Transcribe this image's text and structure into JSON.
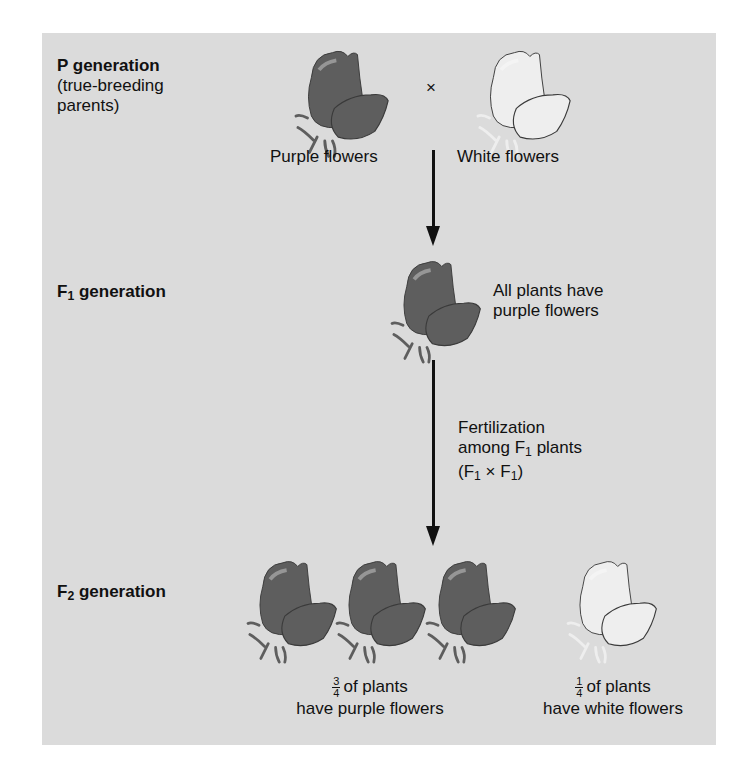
{
  "diagram": {
    "background_color": "#dbdbdb",
    "colors": {
      "purple_flower": "#5e5e5e",
      "white_flower": "#eeeeee",
      "text": "#111111"
    },
    "p_generation": {
      "label_bold": "P generation",
      "label_line2": "(true-breeding",
      "label_line3": "parents)",
      "cross_symbol": "×",
      "parent1_label": "Purple flowers",
      "parent2_label": "White flowers"
    },
    "f1_generation": {
      "label_prefix": "F",
      "label_sub": "1",
      "label_suffix": " generation",
      "description_line1": "All plants have",
      "description_line2": "purple flowers"
    },
    "fertilization": {
      "line1": "Fertilization",
      "line2_prefix": "among F",
      "line2_sub": "1",
      "line2_suffix": " plants",
      "line3_open": "(F",
      "line3_sub1": "1",
      "line3_mid": " × F",
      "line3_sub2": "1",
      "line3_close": ")"
    },
    "f2_generation": {
      "label_prefix": "F",
      "label_sub": "2",
      "label_suffix": " generation",
      "purple_fraction_num": "3",
      "purple_fraction_den": "4",
      "purple_line1": "of plants",
      "purple_line2": "have purple flowers",
      "white_fraction_num": "1",
      "white_fraction_den": "4",
      "white_line1": "of plants",
      "white_line2": "have white flowers",
      "purple_count": 3,
      "white_count": 1
    }
  }
}
